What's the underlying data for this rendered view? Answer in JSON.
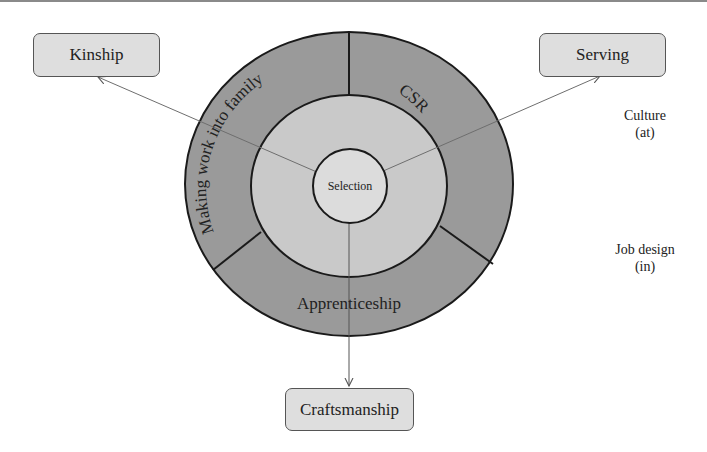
{
  "diagram": {
    "type": "concentric-circle-diagram",
    "center": {
      "label": "Selection"
    },
    "middle_ring": {
      "label": ""
    },
    "outer_ring": {
      "segments": [
        {
          "label": "Making work into family",
          "position": "left"
        },
        {
          "label": "CSR",
          "position": "right"
        },
        {
          "label": "Apprenticeship",
          "position": "bottom"
        }
      ]
    },
    "outcome_boxes": [
      {
        "label": "Kinship",
        "position": "top-left"
      },
      {
        "label": "Serving",
        "position": "top-right"
      },
      {
        "label": "Craftsmanship",
        "position": "bottom"
      }
    ],
    "side_labels": [
      {
        "line1": "Culture",
        "line2": "(at)"
      },
      {
        "line1": "Job design",
        "line2": "(in)"
      }
    ],
    "arrows": [
      {
        "from": "Selection",
        "to": "Kinship"
      },
      {
        "from": "Selection",
        "to": "Serving"
      },
      {
        "from": "Selection",
        "to": "Craftsmanship"
      }
    ],
    "colors": {
      "outer_ring": "#9a9a9a",
      "middle_ring": "#c9c9c9",
      "inner_circle": "#dcdcdc",
      "box_fill": "#dedede",
      "stroke": "#1a1a1a",
      "arrow": "#6e6e6e"
    }
  }
}
